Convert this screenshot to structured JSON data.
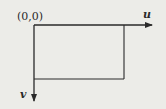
{
  "diagram": {
    "origin_label": "(0,0)",
    "axes": {
      "horizontal": {
        "label": "u",
        "direction": "right"
      },
      "vertical": {
        "label": "v",
        "direction": "down"
      }
    },
    "shapes": [
      {
        "type": "rectangle",
        "description": "image region anchored at origin"
      }
    ],
    "colors": {
      "background": "#ecece8",
      "stroke": "#2a2a2a"
    }
  }
}
